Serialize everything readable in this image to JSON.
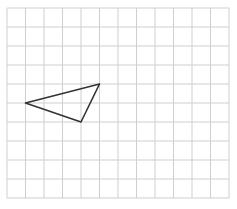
{
  "grid": {
    "columns": 12,
    "rows": 10,
    "origin_x": 7,
    "origin_y": 8,
    "cell_w": 18.5,
    "cell_h": 19.0,
    "line_color": "#cfcfcf",
    "background": "#ffffff"
  },
  "triangle": {
    "vertices": [
      {
        "col": 1,
        "row": 5
      },
      {
        "col": 5,
        "row": 4
      },
      {
        "col": 4,
        "row": 6
      }
    ],
    "stroke_color": "#333333",
    "stroke_width": 1.6
  }
}
